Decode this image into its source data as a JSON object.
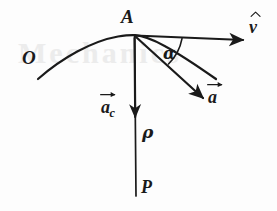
{
  "figure": {
    "type": "hand-drawn-physics-diagram",
    "background_color": "#fdfdfd",
    "ink_color": "#1a1a1a"
  },
  "labels": {
    "point_a": "A",
    "point_o": "O",
    "point_p": "P",
    "angle_alpha": "α",
    "radius_rho": "ρ",
    "velocity_base": "v",
    "acceleration_base": "a",
    "centripetal_base": "a",
    "centripetal_subscript": "c"
  },
  "elements": {
    "trajectory_curve": "trajectory-path",
    "velocity_vector": "velocity-unit-vector-v-hat",
    "acceleration_vector": "acceleration-vector-a",
    "centripetal_vector": "centripetal-acceleration-vector-a-c",
    "radius_line": "radius-of-curvature-line-A-to-P",
    "angle_arc": "angle-arc-alpha"
  },
  "geometry": {
    "point_A": [
      134,
      35
    ],
    "point_P": [
      136,
      196
    ],
    "velocity_tip": [
      246,
      40
    ],
    "acceleration_tip": [
      206,
      101
    ],
    "centripetal_tip": [
      135,
      119
    ],
    "curve_start": [
      38,
      79
    ],
    "curve_end": [
      216,
      79
    ],
    "alpha_degrees": 30
  },
  "background_bleed": {
    "text": "Mechanics"
  }
}
